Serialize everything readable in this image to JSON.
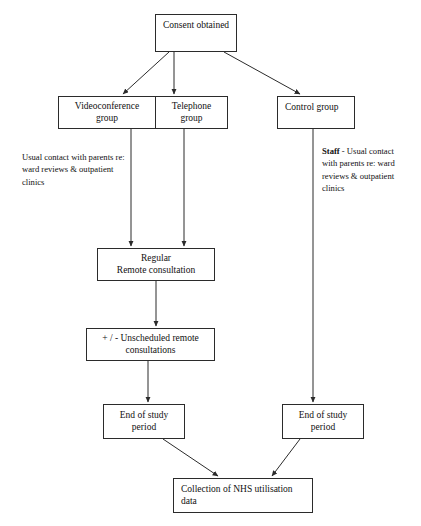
{
  "diagram": {
    "stroke_color": "#2b2b2b",
    "background_color": "#ffffff",
    "nodes": {
      "consent": "Consent obtained",
      "videoconference": "Videoconference\ngroup",
      "telephone": "Telephone\ngroup",
      "control": "Control group",
      "regular_remote": "Regular\nRemote consultation",
      "unscheduled": "+ / - Unscheduled remote\nconsultations",
      "end_of_study_left": "End of study\nperiod",
      "end_of_study_right": "End of study\nperiod",
      "collection": "Collection of NHS utilisation data"
    },
    "annotations": {
      "left": "Usual contact with parents re:\nward reviews & outpatient\nclinics",
      "right_lead": "Staff",
      "right_body": " - Usual contact\nwith parents re: ward\nreviews & outpatient\nclinics"
    },
    "edges": [
      {
        "name": "consent-to-videoconference",
        "from": "consent",
        "to": "videoconference"
      },
      {
        "name": "consent-to-telephone",
        "from": "consent",
        "to": "telephone"
      },
      {
        "name": "consent-to-control",
        "from": "consent",
        "to": "control"
      },
      {
        "name": "videoconference-to-regular",
        "from": "videoconference",
        "to": "regular_remote"
      },
      {
        "name": "telephone-to-regular",
        "from": "telephone",
        "to": "regular_remote"
      },
      {
        "name": "regular-to-unscheduled",
        "from": "regular_remote",
        "to": "unscheduled"
      },
      {
        "name": "unscheduled-to-end-left",
        "from": "unscheduled",
        "to": "end_of_study_left"
      },
      {
        "name": "control-to-end-right",
        "from": "control",
        "to": "end_of_study_right"
      },
      {
        "name": "end-left-to-collection",
        "from": "end_of_study_left",
        "to": "collection"
      },
      {
        "name": "end-right-to-collection",
        "from": "end_of_study_right",
        "to": "collection"
      }
    ]
  }
}
